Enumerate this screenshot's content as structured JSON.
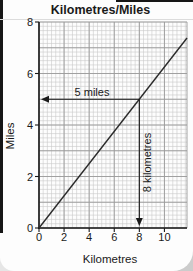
{
  "chart_data": {
    "type": "line",
    "title": "Kilometres/Miles",
    "xlabel": "Kilometres",
    "ylabel": "Miles",
    "xlim": [
      0,
      11.8
    ],
    "ylim": [
      0,
      8
    ],
    "x_ticks": [
      0,
      2,
      4,
      6,
      8,
      10
    ],
    "y_ticks": [
      0,
      2,
      4,
      6,
      8
    ],
    "grid": "on",
    "legend": "none",
    "series": [
      {
        "name": "kilometres-to-miles conversion line",
        "relation": "miles = kilometres x 5/8",
        "x": [
          0,
          11.8
        ],
        "y": [
          0,
          7.38
        ]
      }
    ],
    "annotations": [
      {
        "label": "5 miles",
        "axis": "y",
        "value": 5,
        "arrow": "left",
        "at_km": 8
      },
      {
        "label": "8 kilometres",
        "axis": "x",
        "value": 8,
        "arrow": "down",
        "at_miles": 5
      }
    ],
    "colors": {
      "minor_grid": "#c9c9c9",
      "major_grid": "#9a9a9a",
      "axis": "#1a1a1a",
      "line": "#2b2b2b",
      "text": "#1a1a1a"
    }
  }
}
